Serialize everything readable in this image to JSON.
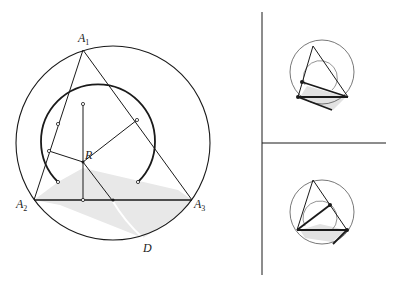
{
  "figure": {
    "main": {
      "labels": {
        "A1": "A",
        "A1_sub": "1",
        "A2": "A",
        "A2_sub": "2",
        "A3": "A",
        "A3_sub": "3",
        "R": "R",
        "D": "D"
      },
      "colors": {
        "stroke": "#1a1a1a",
        "shade": "#e6e6e6"
      }
    },
    "insets": [
      {
        "name": "top-inset",
        "description": "triangle inscribed in circle with bold segments and shaded band"
      },
      {
        "name": "bottom-inset",
        "description": "triangle inscribed in circle with bold segments and shaded band, rotated configuration"
      }
    ]
  }
}
